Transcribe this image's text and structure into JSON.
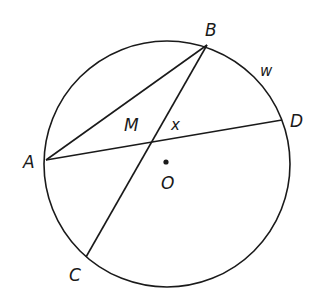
{
  "diagram": {
    "type": "circle-geometry",
    "circle": {
      "center_label": "O",
      "cx": 167,
      "cy": 164,
      "r": 123
    },
    "points": {
      "A": {
        "label": "A",
        "x": 46,
        "y": 160
      },
      "B": {
        "label": "B",
        "x": 207,
        "y": 45
      },
      "C": {
        "label": "C",
        "x": 86,
        "y": 257
      },
      "D": {
        "label": "D",
        "x": 282,
        "y": 120
      },
      "M": {
        "label": "M",
        "x": 153,
        "y": 140
      },
      "O": {
        "label": "O",
        "x": 166,
        "y": 162
      }
    },
    "segments": [
      "AB",
      "AD",
      "BC"
    ],
    "annotations": {
      "angle_label": "x",
      "arc_label": "w"
    },
    "colors": {
      "stroke": "#1a1a1a",
      "background": "#ffffff"
    }
  }
}
